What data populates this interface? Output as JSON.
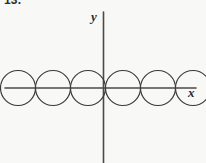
{
  "figure": {
    "problem_number": "13.",
    "background_color": "#f8f8f6",
    "curve_color": "#3a3a3a",
    "axis_color": "#4a4a4a",
    "label_color": "#2b2b2b",
    "watermark_text": "",
    "axes": {
      "x_label": "x",
      "y_label": "y",
      "x_axis": {
        "y_pixel": 88,
        "x_start": 5,
        "x_end": 196
      },
      "y_axis": {
        "x_pixel": 103,
        "y_start": 12,
        "y_end": 163
      },
      "origin": {
        "x": 103,
        "y": 88
      },
      "ticks": [],
      "tick_labels": []
    }
  },
  "chart_data": {
    "type": "line",
    "title": "",
    "subtitle": "",
    "xlabel": "x",
    "ylabel": "y",
    "grid": false,
    "legend": null,
    "legend_position": "none",
    "xlim": [
      5,
      196
    ],
    "ylim": [
      -17.5,
      17.5
    ],
    "shape": "circle-chain",
    "circle_radius": 17.5,
    "circle_center_y": 88,
    "circle_centers_x": [
      18,
      53,
      88,
      123,
      158,
      193
    ],
    "intersections_x": [
      0.5,
      35.5,
      70.5,
      105.5,
      140.5,
      175.5
    ],
    "series": [
      {
        "name": "circle-1",
        "center": [
          18,
          88
        ],
        "radius": 17.5
      },
      {
        "name": "circle-2",
        "center": [
          53,
          88
        ],
        "radius": 17.5
      },
      {
        "name": "circle-3",
        "center": [
          88,
          88
        ],
        "radius": 17.5
      },
      {
        "name": "circle-4",
        "center": [
          123,
          88
        ],
        "radius": 17.5
      },
      {
        "name": "circle-5",
        "center": [
          158,
          88
        ],
        "radius": 17.5
      },
      {
        "name": "circle-6",
        "center": [
          193,
          88
        ],
        "radius": 17.5
      }
    ]
  }
}
